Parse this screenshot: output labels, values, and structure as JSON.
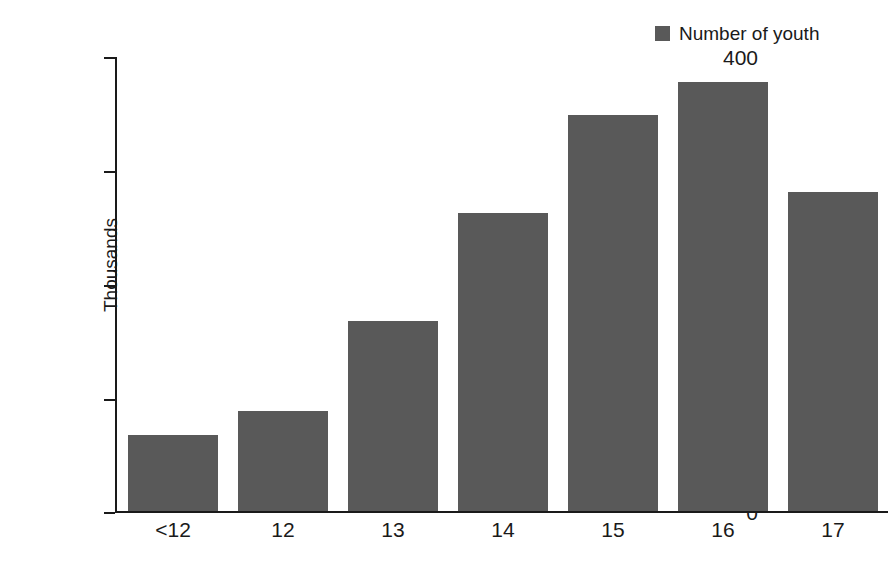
{
  "legend": {
    "swatch_color": "#595959",
    "label": "Number of youth"
  },
  "axes": {
    "y_title": "Thousands",
    "y_ticks": [
      "400",
      "300",
      "200",
      "100",
      "0"
    ],
    "x_ticks": [
      "<12",
      "12",
      "13",
      "14",
      "15",
      "16",
      "17"
    ]
  },
  "chart_data": {
    "type": "bar",
    "title": "",
    "subtitle": "",
    "xlabel": "",
    "ylabel": "Thousands",
    "categories": [
      "<12",
      "12",
      "13",
      "14",
      "15",
      "16",
      "17"
    ],
    "values": [
      67,
      88,
      167,
      263,
      349,
      378,
      281
    ],
    "series": [
      {
        "name": "Number of youth",
        "color": "#595959",
        "values": [
          67,
          88,
          167,
          263,
          349,
          378,
          281
        ]
      }
    ],
    "ylim": [
      0,
      400
    ],
    "ytick_values": [
      400,
      300,
      200,
      100,
      0
    ],
    "grid": false,
    "legend_position": "top-right",
    "units": "thousands",
    "bar_color": "#595959",
    "background_color": "#ffffff"
  }
}
